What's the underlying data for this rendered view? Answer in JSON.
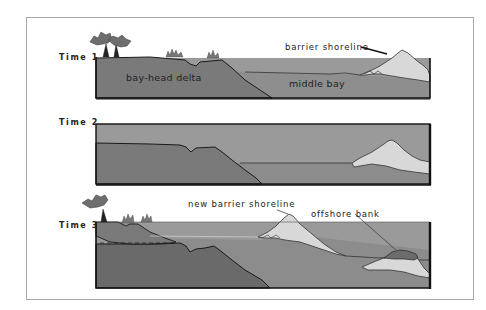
{
  "figure": {
    "panels": [
      {
        "id": "time1",
        "label": "Time 1",
        "annotations": {
          "delta": "bay-head delta",
          "bay": "middle bay",
          "barrier": "barrier shoreline"
        }
      },
      {
        "id": "time2",
        "label": "Time 2"
      },
      {
        "id": "time3",
        "label": "Time 3",
        "annotations": {
          "new_barrier": "new barrier shoreline",
          "bank": "offshore bank"
        }
      }
    ],
    "colors": {
      "water": "#9a9a9a",
      "bay_fill": "#8c8c8c",
      "delta": "#7a7a7a",
      "deep_substrate": "#6a6a6a",
      "sand": "#d8d8d8",
      "bank_cap": "#6c6c6c",
      "outline": "#1a1a1a",
      "vegetation": "#6e6e6e",
      "frame": "#a8a8a8"
    }
  }
}
